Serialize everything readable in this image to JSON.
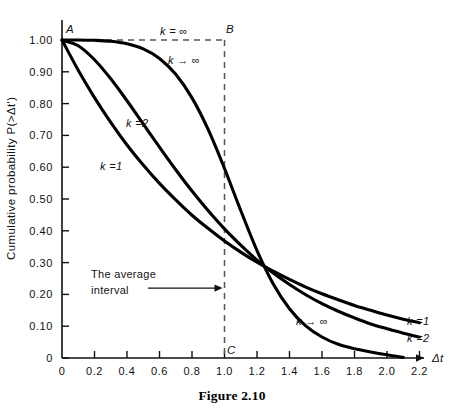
{
  "caption": "Figure 2.10",
  "chart_data": {
    "type": "line",
    "title": "",
    "xlabel": "Δt",
    "ylabel": "Cumulative probability P(>Δt')",
    "xlim": [
      0,
      2.3
    ],
    "ylim": [
      0,
      1.05
    ],
    "grid": false,
    "legend_position": "inline-curve-labels",
    "x_ticks": [
      "0",
      "0.2",
      "0.4",
      "0.6",
      "0.8",
      "1.0",
      "1.2",
      "1.4",
      "1.6",
      "1.8",
      "2.0",
      "2.2"
    ],
    "x_tick_values": [
      0,
      0.2,
      0.4,
      0.6,
      0.8,
      1.0,
      1.2,
      1.4,
      1.6,
      1.8,
      2.0,
      2.2
    ],
    "y_ticks": [
      "0",
      "0.10",
      "0.20",
      "0.30",
      "0.40",
      "0.50",
      "0.60",
      "0.70",
      "0.80",
      "0.90",
      "1.00"
    ],
    "y_tick_values": [
      0,
      0.1,
      0.2,
      0.3,
      0.4,
      0.5,
      0.6,
      0.7,
      0.8,
      0.9,
      1.0
    ],
    "series": [
      {
        "name": "k = 1",
        "label": "k =1",
        "label_left": "k =1",
        "label_right": "k =1",
        "x": [
          0.0,
          0.1,
          0.2,
          0.3,
          0.4,
          0.5,
          0.6,
          0.7,
          0.8,
          0.9,
          1.0,
          1.1,
          1.2,
          1.3,
          1.4,
          1.5,
          1.6,
          1.7,
          1.8,
          1.9,
          2.0,
          2.1,
          2.2
        ],
        "y": [
          1.0,
          0.905,
          0.819,
          0.741,
          0.67,
          0.607,
          0.549,
          0.497,
          0.449,
          0.407,
          0.368,
          0.333,
          0.301,
          0.273,
          0.247,
          0.223,
          0.202,
          0.183,
          0.165,
          0.15,
          0.135,
          0.122,
          0.111
        ]
      },
      {
        "name": "k = 2",
        "label": "k =2",
        "label_right": "k =2",
        "x": [
          0.0,
          0.1,
          0.2,
          0.3,
          0.4,
          0.5,
          0.6,
          0.7,
          0.8,
          0.9,
          1.0,
          1.1,
          1.2,
          1.3,
          1.4,
          1.5,
          1.6,
          1.7,
          1.8,
          1.9,
          2.0,
          2.1,
          2.2
        ],
        "y": [
          1.0,
          0.982,
          0.938,
          0.878,
          0.809,
          0.736,
          0.663,
          0.592,
          0.525,
          0.463,
          0.406,
          0.355,
          0.308,
          0.267,
          0.231,
          0.199,
          0.171,
          0.147,
          0.126,
          0.107,
          0.092,
          0.078,
          0.066
        ]
      },
      {
        "name": "k → ∞",
        "label": "k → ∞",
        "label_left": "k → ∞",
        "label_right": "k → ∞",
        "x": [
          0.0,
          0.1,
          0.2,
          0.3,
          0.4,
          0.5,
          0.6,
          0.7,
          0.8,
          0.9,
          1.0,
          1.1,
          1.2,
          1.3,
          1.4,
          1.5,
          1.6,
          1.7,
          1.8,
          1.9,
          2.0,
          2.1
        ],
        "y": [
          1.0,
          1.0,
          0.999,
          0.996,
          0.988,
          0.972,
          0.942,
          0.892,
          0.818,
          0.718,
          0.596,
          0.464,
          0.338,
          0.233,
          0.155,
          0.101,
          0.066,
          0.043,
          0.029,
          0.019,
          0.01,
          0.002
        ]
      }
    ],
    "reference_box": {
      "label": "k = ∞",
      "points": {
        "A": {
          "name": "A",
          "x": 0.0,
          "y": 1.0
        },
        "B": {
          "name": "B",
          "x": 1.0,
          "y": 1.0
        },
        "C": {
          "name": "C",
          "x": 1.0,
          "y": 0.0
        }
      }
    },
    "annotations": [
      {
        "name": "average-interval",
        "line1": "The average",
        "line2": "interval",
        "arrow_to_x": 1.0,
        "arrow_to_y": 0.22
      }
    ]
  }
}
